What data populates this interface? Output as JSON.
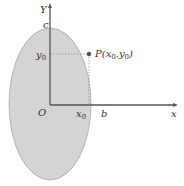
{
  "diagram": {
    "type": "coordinate-ellipse",
    "colors": {
      "ellipse_fill": "#d4d4d4",
      "ellipse_stroke": "#a8a8a8",
      "axis": "#555555",
      "text": "#333333",
      "point": "#555555",
      "guide": "#888888"
    },
    "axes": {
      "y_label": "Y",
      "x_label": "x",
      "origin_label": "O"
    },
    "ellipse_labels": {
      "top": "c",
      "right": "b"
    },
    "point": {
      "name": "P",
      "label_prefix": "P(",
      "x_var": "x",
      "x_sub": "0",
      "sep": ",",
      "y_var": "y",
      "y_sub": "0",
      "label_suffix": ")"
    },
    "projections": {
      "x_var": "x",
      "x_sub": "0",
      "y_var": "y",
      "y_sub": "0"
    }
  }
}
